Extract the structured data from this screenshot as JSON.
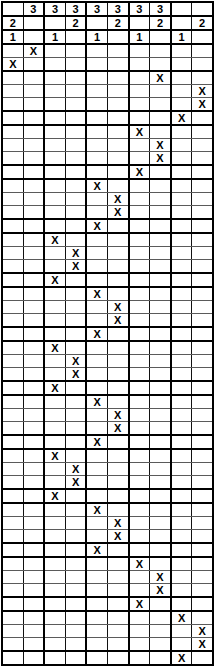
{
  "grid": {
    "columns": 10,
    "mark_glyph": "X",
    "colors": {
      "ink": "#000000",
      "cell_line": "#5a5a5a",
      "heavy_line": "#000000",
      "background": "#ffffff"
    },
    "header_rows": [
      {
        "cells": [
          "",
          "3",
          "3",
          "3",
          "3",
          "3",
          "3",
          "3",
          "",
          ""
        ]
      },
      {
        "cells": [
          "2",
          "",
          "",
          "2",
          "",
          "2",
          "",
          "2",
          "",
          "2"
        ]
      },
      {
        "cells": [
          "1",
          "",
          "1",
          "",
          "1",
          "",
          "1",
          "",
          "1",
          ""
        ]
      }
    ],
    "body_rows": [
      {
        "mark_col": 2
      },
      {
        "mark_col": 1
      },
      {
        "mark_col": 8,
        "band_start": true
      },
      {
        "mark_col": 10
      },
      {
        "mark_col": 10
      },
      {
        "mark_col": 9,
        "band_start": true
      },
      {
        "mark_col": 7,
        "band_start": true
      },
      {
        "mark_col": 8
      },
      {
        "mark_col": 8
      },
      {
        "mark_col": 7,
        "band_start": true
      },
      {
        "mark_col": 5,
        "band_start": true
      },
      {
        "mark_col": 6
      },
      {
        "mark_col": 6
      },
      {
        "mark_col": 5,
        "band_start": true
      },
      {
        "mark_col": 3,
        "band_start": true
      },
      {
        "mark_col": 4
      },
      {
        "mark_col": 4
      },
      {
        "mark_col": 3,
        "band_start": true
      },
      {
        "mark_col": 5,
        "band_start": true
      },
      {
        "mark_col": 6
      },
      {
        "mark_col": 6
      },
      {
        "mark_col": 5,
        "band_start": true
      },
      {
        "mark_col": 3,
        "band_start": true
      },
      {
        "mark_col": 4
      },
      {
        "mark_col": 4
      },
      {
        "mark_col": 3,
        "band_start": true
      },
      {
        "mark_col": 5,
        "band_start": true
      },
      {
        "mark_col": 6
      },
      {
        "mark_col": 6
      },
      {
        "mark_col": 5,
        "band_start": true
      },
      {
        "mark_col": 3,
        "band_start": true
      },
      {
        "mark_col": 4
      },
      {
        "mark_col": 4
      },
      {
        "mark_col": 3,
        "band_start": true
      },
      {
        "mark_col": 5,
        "band_start": true
      },
      {
        "mark_col": 6
      },
      {
        "mark_col": 6
      },
      {
        "mark_col": 5,
        "band_start": true
      },
      {
        "mark_col": 7,
        "band_start": true
      },
      {
        "mark_col": 8
      },
      {
        "mark_col": 8
      },
      {
        "mark_col": 7,
        "band_start": true
      },
      {
        "mark_col": 9,
        "band_start": true
      },
      {
        "mark_col": 10
      },
      {
        "mark_col": 10
      },
      {
        "mark_col": 9,
        "band_start": true
      }
    ]
  },
  "chart_data": {
    "type": "heatmap",
    "title": "",
    "xlabel": "",
    "ylabel": "",
    "grid": true,
    "legend": "none",
    "columns": [
      1,
      2,
      3,
      4,
      5,
      6,
      7,
      8,
      9,
      10
    ],
    "header_numbers": {
      "row_3": {
        "label": "3",
        "columns": [
          2,
          3,
          4,
          5,
          6,
          7,
          8
        ]
      },
      "row_2": {
        "label": "2",
        "columns": [
          1,
          4,
          6,
          8,
          10
        ]
      },
      "row_1": {
        "label": "1",
        "columns": [
          1,
          3,
          5,
          7,
          9
        ]
      }
    },
    "marked_cells": [
      {
        "row": 1,
        "col": 2
      },
      {
        "row": 2,
        "col": 1
      },
      {
        "row": 3,
        "col": 8
      },
      {
        "row": 4,
        "col": 10
      },
      {
        "row": 5,
        "col": 10
      },
      {
        "row": 6,
        "col": 9
      },
      {
        "row": 7,
        "col": 7
      },
      {
        "row": 8,
        "col": 8
      },
      {
        "row": 9,
        "col": 8
      },
      {
        "row": 10,
        "col": 7
      },
      {
        "row": 11,
        "col": 5
      },
      {
        "row": 12,
        "col": 6
      },
      {
        "row": 13,
        "col": 6
      },
      {
        "row": 14,
        "col": 5
      },
      {
        "row": 15,
        "col": 3
      },
      {
        "row": 16,
        "col": 4
      },
      {
        "row": 17,
        "col": 4
      },
      {
        "row": 18,
        "col": 3
      },
      {
        "row": 19,
        "col": 5
      },
      {
        "row": 20,
        "col": 6
      },
      {
        "row": 21,
        "col": 6
      },
      {
        "row": 22,
        "col": 5
      },
      {
        "row": 23,
        "col": 3
      },
      {
        "row": 24,
        "col": 4
      },
      {
        "row": 25,
        "col": 4
      },
      {
        "row": 26,
        "col": 3
      },
      {
        "row": 27,
        "col": 5
      },
      {
        "row": 28,
        "col": 6
      },
      {
        "row": 29,
        "col": 6
      },
      {
        "row": 30,
        "col": 5
      },
      {
        "row": 31,
        "col": 3
      },
      {
        "row": 32,
        "col": 4
      },
      {
        "row": 33,
        "col": 4
      },
      {
        "row": 34,
        "col": 3
      },
      {
        "row": 35,
        "col": 5
      },
      {
        "row": 36,
        "col": 6
      },
      {
        "row": 37,
        "col": 6
      },
      {
        "row": 38,
        "col": 5
      },
      {
        "row": 39,
        "col": 7
      },
      {
        "row": 40,
        "col": 8
      },
      {
        "row": 41,
        "col": 8
      },
      {
        "row": 42,
        "col": 7
      },
      {
        "row": 43,
        "col": 9
      },
      {
        "row": 44,
        "col": 10
      },
      {
        "row": 45,
        "col": 10
      },
      {
        "row": 46,
        "col": 9
      }
    ],
    "rows_total": 46,
    "header_rows_total": 3
  }
}
